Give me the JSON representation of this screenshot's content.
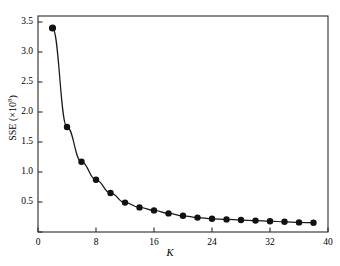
{
  "chart_data": {
    "type": "line",
    "title": "",
    "subtitle": "",
    "xlabel": "K",
    "ylabel": "SSE (×10⁸)",
    "ylabel_base": "SSE (×10",
    "ylabel_exponent": "8",
    "ylabel_close": ")",
    "xlim": [
      0,
      40
    ],
    "ylim": [
      0,
      3.6
    ],
    "grid": false,
    "legend": null,
    "marker": "filled-circle",
    "line_color": "#1a1a1a",
    "marker_color": "#111111",
    "axis_color": "#2b2b2b",
    "background": "#ffffff",
    "xticks": [
      0,
      8,
      16,
      24,
      32,
      40
    ],
    "xtick_labels": [
      "0",
      "8",
      "16",
      "24",
      "32",
      "40"
    ],
    "yticks": [
      0.0,
      0.5,
      1.0,
      1.5,
      2.0,
      2.5,
      3.0,
      3.5
    ],
    "ytick_labels": [
      "",
      "0.5",
      "1.0",
      "1.5",
      "2.0",
      "2.5",
      "3.0",
      "3.5"
    ],
    "x": [
      2,
      4,
      6,
      8,
      10,
      12,
      14,
      16,
      18,
      20,
      22,
      24,
      26,
      28,
      30,
      32,
      34,
      36,
      38
    ],
    "values": [
      3.4,
      1.75,
      1.17,
      0.87,
      0.65,
      0.49,
      0.41,
      0.36,
      0.31,
      0.27,
      0.24,
      0.22,
      0.21,
      0.2,
      0.19,
      0.18,
      0.17,
      0.16,
      0.155
    ],
    "series": [
      {
        "name": "SSE",
        "x": [
          2,
          4,
          6,
          8,
          10,
          12,
          14,
          16,
          18,
          20,
          22,
          24,
          26,
          28,
          30,
          32,
          34,
          36,
          38
        ],
        "values": [
          3.4,
          1.75,
          1.17,
          0.87,
          0.65,
          0.49,
          0.41,
          0.36,
          0.31,
          0.27,
          0.24,
          0.22,
          0.21,
          0.2,
          0.19,
          0.18,
          0.17,
          0.16,
          0.155
        ]
      }
    ],
    "annotations": []
  }
}
